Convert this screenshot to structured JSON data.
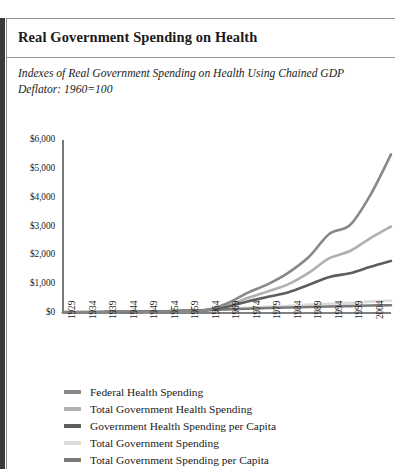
{
  "title": "Real Government Spending on Health",
  "subtitle": "Indexes of Real Government Spending on Health Using Chained GDP Deflator: 1960=100",
  "chart_data": {
    "type": "line",
    "title": "Real Government Spending on Health",
    "subtitle": "Indexes of Real Government Spending on Health Using Chained GDP Deflator: 1960=100",
    "xlabel": "",
    "ylabel": "",
    "xlim": [
      1929,
      2009
    ],
    "ylim": [
      0,
      6000
    ],
    "grid": false,
    "legend_position": "bottom",
    "ytick_labels": [
      "$0",
      "$1,000",
      "$2,000",
      "$3,000",
      "$4,000",
      "$5,000",
      "$6,000"
    ],
    "ytick_values": [
      0,
      1000,
      2000,
      3000,
      4000,
      5000,
      6000
    ],
    "xtick_labels": [
      "1929",
      "1934",
      "1939",
      "1944",
      "1949",
      "1954",
      "1959",
      "1964",
      "1969",
      "1974",
      "1979",
      "1984",
      "1989",
      "1994",
      "1999",
      "2004",
      "2009"
    ],
    "xtick_values": [
      1929,
      1934,
      1939,
      1944,
      1949,
      1954,
      1959,
      1964,
      1969,
      1974,
      1979,
      1984,
      1989,
      1994,
      1999,
      2004,
      2009
    ],
    "x": [
      1929,
      1934,
      1939,
      1944,
      1949,
      1954,
      1959,
      1964,
      1969,
      1974,
      1979,
      1984,
      1989,
      1994,
      1999,
      2004,
      2009
    ],
    "series": [
      {
        "name": "Federal Health Spending",
        "color": "#888888",
        "values": [
          20,
          22,
          28,
          60,
          45,
          55,
          75,
          100,
          330,
          700,
          1000,
          1400,
          1950,
          2750,
          3050,
          4100,
          5500
        ]
      },
      {
        "name": "Total Government Health Spending",
        "color": "#b0b0b0",
        "values": [
          25,
          28,
          35,
          55,
          50,
          62,
          80,
          100,
          250,
          520,
          750,
          1000,
          1400,
          1900,
          2150,
          2600,
          3000
        ]
      },
      {
        "name": "Government Health Spending per Capita",
        "color": "#5e5e5e",
        "values": [
          30,
          32,
          38,
          52,
          48,
          58,
          78,
          100,
          210,
          400,
          560,
          720,
          980,
          1250,
          1380,
          1600,
          1800
        ]
      },
      {
        "name": "Total Government Spending",
        "color": "#dcdcdc",
        "values": [
          15,
          18,
          24,
          70,
          40,
          55,
          72,
          100,
          140,
          180,
          215,
          250,
          290,
          320,
          350,
          395,
          430
        ]
      },
      {
        "name": "Total Government Spending per Capita",
        "color": "#7a7a7a",
        "values": [
          20,
          22,
          27,
          62,
          42,
          55,
          74,
          100,
          125,
          150,
          172,
          190,
          210,
          228,
          240,
          258,
          270
        ]
      }
    ]
  },
  "legend": [
    {
      "label": "Federal Health Spending",
      "color": "#888888"
    },
    {
      "label": "Total Government Health Spending",
      "color": "#b0b0b0"
    },
    {
      "label": "Government Health Spending per Capita",
      "color": "#5e5e5e"
    },
    {
      "label": "Total Government Spending",
      "color": "#dcdcdc"
    },
    {
      "label": "Total Government Spending per Capita",
      "color": "#7a7a7a"
    }
  ]
}
